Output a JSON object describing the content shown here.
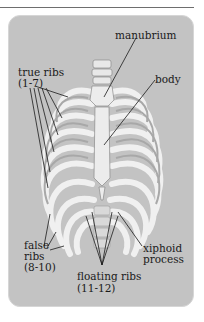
{
  "figure": {
    "colors": {
      "panel": "#c3c3c3",
      "bone": "#ececec",
      "cartilage_shade": "#a8a8a8",
      "leader": "#1a1a1a",
      "rule": "#6e6e6e"
    },
    "labels": {
      "manubrium": "manubrium",
      "body": "body",
      "true_ribs_1": "true ribs",
      "true_ribs_2": "(1-7)",
      "false_ribs_1": "false",
      "false_ribs_2": "ribs",
      "false_ribs_3": "(8-10)",
      "xiphoid_1": "xiphoid",
      "xiphoid_2": "process",
      "floating_1": "floating ribs",
      "floating_2": "(11-12)"
    }
  }
}
